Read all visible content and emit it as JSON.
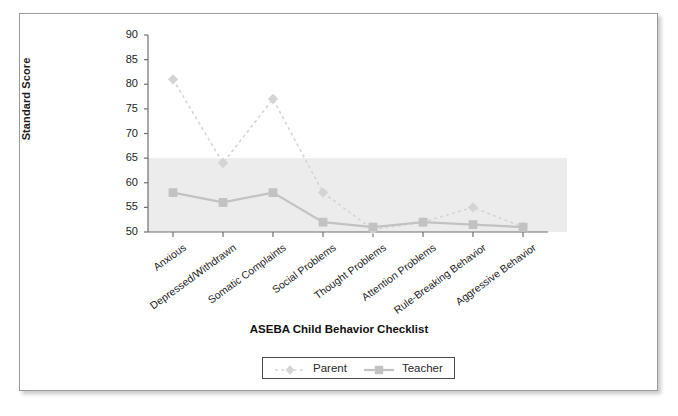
{
  "chart_data": {
    "type": "line",
    "title": "",
    "xlabel": "ASEBA Child Behavior Checklist",
    "ylabel": "Standard Score",
    "ylim": [
      50,
      90
    ],
    "yticks": [
      50,
      55,
      60,
      65,
      70,
      75,
      80,
      85,
      90
    ],
    "grid": false,
    "legend_position": "bottom",
    "categories": [
      "Anxious",
      "Depressed/Withdrawn",
      "Somatic Complaints",
      "Social Problems",
      "Thought Problems",
      "Attention Problems",
      "Rule-Breaking Behavior",
      "Aggressive Behavior"
    ],
    "series": [
      {
        "name": "Parent",
        "values": [
          81,
          64,
          77,
          58,
          50.5,
          52,
          55,
          51
        ],
        "color": "#d4d4d4",
        "marker": "diamond",
        "linestyle": "dotted"
      },
      {
        "name": "Teacher",
        "values": [
          58,
          56,
          58,
          52,
          51,
          52,
          51.5,
          51
        ],
        "color": "#c2c2c2",
        "marker": "square",
        "linestyle": "solid"
      }
    ],
    "shaded_band": {
      "label": "borderline-clinical-band",
      "y_from": 50,
      "y_to": 65,
      "color": "#ececec"
    }
  },
  "legend": {
    "entries": [
      {
        "label": "Parent"
      },
      {
        "label": "Teacher"
      }
    ]
  }
}
